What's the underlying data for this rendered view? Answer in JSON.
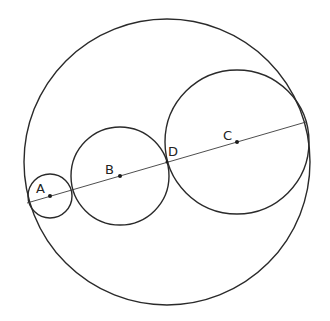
{
  "diagram": {
    "points": [
      {
        "id": "A",
        "label": "A"
      },
      {
        "id": "B",
        "label": "B"
      },
      {
        "id": "C",
        "label": "C"
      },
      {
        "id": "D",
        "label": "D"
      }
    ],
    "circles": [
      {
        "id": "outer",
        "name": "outer-circle"
      },
      {
        "id": "A",
        "name": "circle-a",
        "center": "A"
      },
      {
        "id": "B",
        "name": "circle-b",
        "center": "B"
      },
      {
        "id": "C",
        "name": "circle-c",
        "center": "C"
      }
    ],
    "line": {
      "name": "diameter-line",
      "through": [
        "A",
        "B",
        "D",
        "C"
      ]
    },
    "colors": {
      "stroke": "#2a2a2a",
      "background": "#ffffff"
    }
  }
}
